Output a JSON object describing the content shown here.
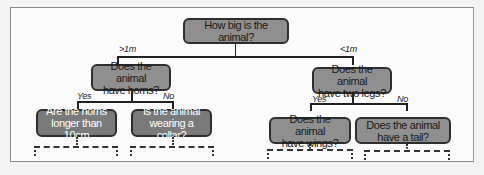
{
  "diagram": {
    "type": "decision-tree",
    "root": {
      "question": "How big is the animal?",
      "branches": [
        {
          "label": ">1m",
          "question": "Does the animal have horns?",
          "question_lines": [
            "Does the animal",
            "have horns?"
          ],
          "branches": [
            {
              "label": "Yes",
              "question": "Are the horns longer than 10cm",
              "question_lines": [
                "Are the horns",
                "longer than 10cm"
              ]
            },
            {
              "label": "No",
              "question": "Is the animal wearing a collar?",
              "question_lines": [
                "Is the animal",
                "wearing a collar?"
              ]
            }
          ]
        },
        {
          "label": "<1m",
          "question": "Does the animal have two legs?",
          "question_lines": [
            "Does the animal",
            "have two legs?"
          ],
          "branches": [
            {
              "label": "Yes",
              "question": "Does the animal have wings?",
              "question_lines": [
                "Does the animal",
                "have wings?"
              ]
            },
            {
              "label": "No",
              "question": "Does the animal have a tail?",
              "question_lines": [
                "Does the animal",
                "have a tail?"
              ]
            }
          ]
        }
      ]
    },
    "colors": {
      "node_fill": "#8f8f8f",
      "node_border": "#2e2e2e",
      "leaf_fill_left": "#7a7a7a",
      "line": "#222222",
      "frame_border": "#8a8a8a"
    }
  }
}
